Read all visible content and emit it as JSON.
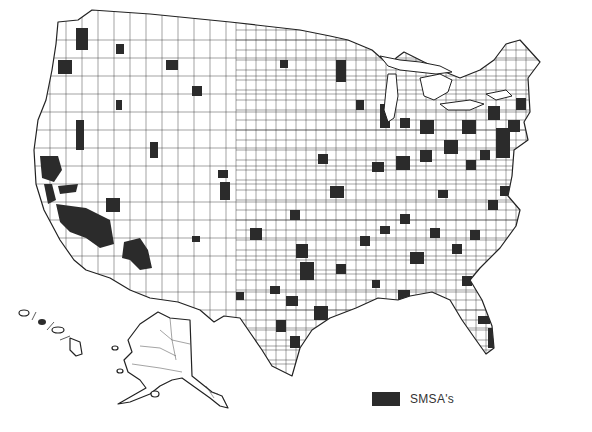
{
  "map": {
    "subject": "United States counties with Standard Metropolitan Statistical Areas shaded",
    "regions": [
      "Contiguous United States",
      "Alaska",
      "Hawaii"
    ],
    "colors": {
      "smsa_fill": "#2b2b2b",
      "county_line": "#333333",
      "background": "#ffffff"
    }
  },
  "legend": {
    "items": [
      {
        "label": "SMSA's",
        "color": "#2b2b2b"
      }
    ]
  }
}
